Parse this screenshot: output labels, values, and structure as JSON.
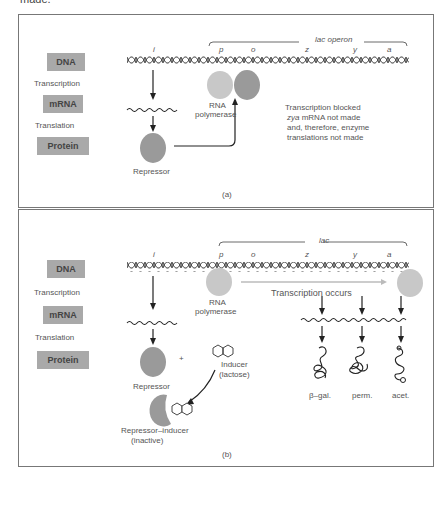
{
  "page": {
    "top_text": "made."
  },
  "legend_rows": {
    "dna": "DNA",
    "transcription": "Transcription",
    "mrna": "mRNA",
    "translation": "Translation",
    "protein": "Protein"
  },
  "panel_a": {
    "bracket_label": "lac operon",
    "genes": [
      "i",
      "p",
      "o",
      "z",
      "y",
      "a"
    ],
    "rna_polymerase": "RNA",
    "rna_polymerase_2": "polymerase",
    "repressor": "Repressor",
    "note_line1": "Transcription blocked",
    "note_line2_italic": "zya",
    "note_line2_rest": " mRNA not made",
    "note_line3": "and, therefore, enzyme",
    "note_line4": "translations not made",
    "caption": "(a)"
  },
  "panel_b": {
    "bracket_label": "lac",
    "genes": [
      "i",
      "p",
      "o",
      "z",
      "y",
      "a"
    ],
    "rna_polymerase": "RNA",
    "rna_polymerase_2": "polymerase",
    "transcription_occurs": "Transcription occurs",
    "repressor": "Repressor",
    "plus": "+",
    "inducer": "Inducer",
    "inducer_2": "(lactose)",
    "complex": "Repressor–inducer",
    "complex_2": "(inactive)",
    "enzymes": [
      "β–gal.",
      "perm.",
      "acet."
    ],
    "caption": "(b)"
  },
  "colors": {
    "label_box": "#a9a9a9",
    "polymerase": "#c8c8c8",
    "repressor": "#9a9a9a",
    "line": "#222222"
  }
}
